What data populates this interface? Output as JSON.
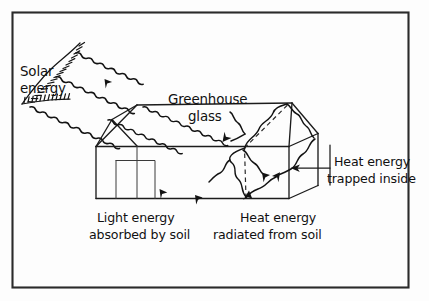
{
  "diagram": {
    "kind": "hand-drawn-science-diagram",
    "frame": {
      "visible": true,
      "color": "#2b2b2b"
    },
    "ink_color": "#131313",
    "background_color": "#fdfdfd"
  },
  "labels": {
    "solar_energy_line1": "Solar",
    "solar_energy_line2": "energy",
    "greenhouse_glass_line1": "Greenhouse",
    "greenhouse_glass_line2": "glass",
    "light_absorbed_line1": "Light energy",
    "light_absorbed_line2": "absorbed by soil",
    "heat_radiated_line1": "Heat energy",
    "heat_radiated_line2": "radiated from soil",
    "heat_trapped_line1": "Heat energy",
    "heat_trapped_line2": "trapped inside"
  },
  "icons": {
    "sun": "sun-icon",
    "solar_ray_1": "wavy-arrow-icon",
    "solar_ray_2": "wavy-arrow-icon",
    "solar_ray_3": "wavy-arrow-icon",
    "heat_ray_up": "wavy-arrow-icon",
    "heat_ray_reflected": "wavy-arrow-icon",
    "heat_ray_down": "wavy-arrow-icon",
    "pointer_arrow": "arrow-left-icon",
    "greenhouse": "greenhouse-icon"
  }
}
